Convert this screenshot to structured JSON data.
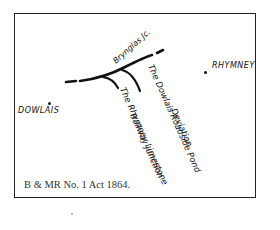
{
  "map": {
    "caption": "B & MR No. 1 Act 1864.",
    "places": [
      {
        "name": "DOWLAIS",
        "x": 20,
        "y": 107
      },
      {
        "name": "RHYMNEY",
        "x": 206,
        "y": 61
      }
    ],
    "labels": {
      "junction": "Brynglas Jc.",
      "deviation_line1": "The Dowlais Roadside Pond",
      "deviation_line2": "Deviation",
      "limestone_line1": "The Rhymney Limestone",
      "limestone_line2": "Railway Junction"
    },
    "colors": {
      "ink": "#111111",
      "frame": "#222222",
      "background": "#ffffff"
    }
  }
}
